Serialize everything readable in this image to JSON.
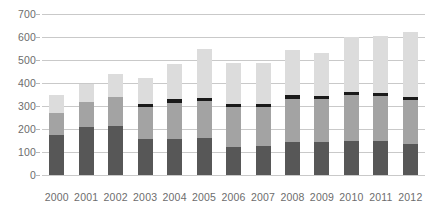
{
  "chart_data": {
    "type": "bar",
    "stacked": true,
    "title": "",
    "subtitle": "",
    "xlabel": "",
    "ylabel": "",
    "ylim": [
      0,
      700
    ],
    "ytick_values": [
      0,
      100,
      200,
      300,
      400,
      500,
      600,
      700
    ],
    "ytick_labels": [
      "0",
      "100",
      "200",
      "300",
      "400",
      "500",
      "600",
      "700"
    ],
    "grid": true,
    "legend": "none",
    "categories": [
      "2000",
      "2001",
      "2002",
      "2003",
      "2004",
      "2005",
      "2006",
      "2007",
      "2008",
      "2009",
      "2010",
      "2011",
      "2012"
    ],
    "series": [
      {
        "name": "segment-1-dark-gray",
        "color": "#575757",
        "values": [
          175,
          208,
          213,
          155,
          158,
          160,
          122,
          124,
          143,
          143,
          150,
          150,
          133
        ]
      },
      {
        "name": "segment-2-medium-gray",
        "color": "#a3a3a3",
        "values": [
          95,
          110,
          125,
          140,
          155,
          160,
          172,
          170,
          187,
          187,
          196,
          192,
          195
        ]
      },
      {
        "name": "segment-3-black",
        "color": "#1a1a1a",
        "values": [
          0,
          0,
          0,
          15,
          16,
          17,
          17,
          16,
          16,
          15,
          16,
          14,
          13
        ]
      },
      {
        "name": "segment-4-light-gray",
        "color": "#dcdcdc",
        "values": [
          80,
          77,
          102,
          112,
          154,
          213,
          177,
          175,
          197,
          185,
          236,
          249,
          282
        ]
      }
    ],
    "totals": [
      350,
      395,
      440,
      422,
      483,
      550,
      488,
      485,
      543,
      530,
      598,
      605,
      623
    ],
    "colors": {
      "gridline": "#c9c9c9",
      "tick_text": "#6d6d6d",
      "background": "#ffffff"
    }
  }
}
